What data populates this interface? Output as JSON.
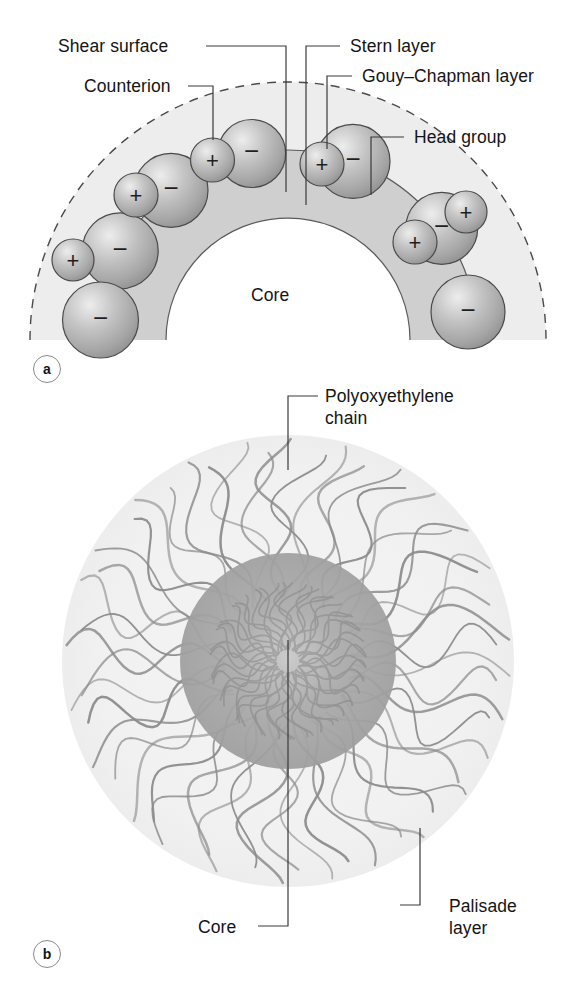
{
  "figure": {
    "background": "#ffffff",
    "width": 576,
    "height": 986
  },
  "colors": {
    "gouy_chapman_band": "#ececec",
    "stern_band": "#cfcfcf",
    "core_fill": "#ffffff",
    "sphere_light": "#e9e9e9",
    "sphere_mid": "#b4b4b4",
    "sphere_dark": "#8f8f8f",
    "sphere_stroke": "#4a4a4a",
    "outline": "#5a5a5a",
    "leader_line": "#3a3a3a",
    "text": "#141414",
    "palisade_fill": "#f2f2f2",
    "core_b_fill": "#9a9a9a",
    "chain_stroke": "#8c8c8c"
  },
  "panel_a": {
    "tag": "a",
    "core_label": "Core",
    "labels": [
      {
        "id": "shear-surface",
        "text": "Shear surface"
      },
      {
        "id": "counterion",
        "text": "Counterion"
      },
      {
        "id": "stern-layer",
        "text": "Stern layer"
      },
      {
        "id": "gouy-chapman",
        "text": "Gouy–Chapman layer"
      },
      {
        "id": "head-group",
        "text": "Head group"
      }
    ],
    "head_groups": [
      {
        "sign": "−",
        "angle_deg": 152,
        "radius_px": 38
      },
      {
        "sign": "−",
        "angle_deg": 128,
        "radius_px": 37
      },
      {
        "sign": "−",
        "angle_deg": 101,
        "radius_px": 34
      },
      {
        "sign": "−",
        "angle_deg": 70,
        "radius_px": 37
      },
      {
        "sign": "−",
        "angle_deg": 36,
        "radius_px": 36
      }
    ],
    "counterions": [
      {
        "sign": "+",
        "angle_deg": 168,
        "radius_px": 21
      },
      {
        "sign": "+",
        "angle_deg": 137,
        "radius_px": 22
      },
      {
        "sign": "+",
        "angle_deg": 99,
        "radius_px": 22
      },
      {
        "sign": "+",
        "angle_deg": 72,
        "radius_px": 22
      },
      {
        "sign": "+",
        "angle_deg": 48,
        "radius_px": 21
      },
      {
        "sign": "+",
        "angle_deg": 24,
        "radius_px": 21
      }
    ]
  },
  "panel_b": {
    "tag": "b",
    "labels": [
      {
        "id": "polyoxyethylene-chain",
        "line1": "Polyoxyethylene",
        "line2": "chain"
      },
      {
        "id": "core",
        "line1": "Core",
        "line2": ""
      },
      {
        "id": "palisade-layer",
        "line1": "Palisade",
        "line2": "layer"
      }
    ]
  }
}
